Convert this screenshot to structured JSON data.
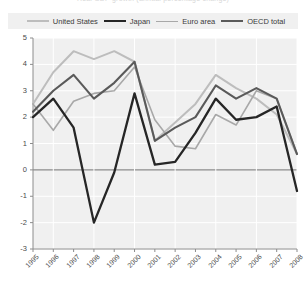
{
  "title": {
    "text": "Real GDP growth (annual percentage change)",
    "clipped": true
  },
  "legend": {
    "items": [
      {
        "label": "United States",
        "color": "#bdbdbd",
        "key": "united_states"
      },
      {
        "label": "Japan",
        "color": "#262626",
        "key": "japan"
      },
      {
        "label": "Euro area",
        "color": "#a8a8a8",
        "key": "euro_area"
      },
      {
        "label": "OECD total",
        "color": "#5a5a5a",
        "key": "oecd_total"
      }
    ]
  },
  "chart_data": {
    "type": "line",
    "title": "",
    "xlabel": "",
    "ylabel": "",
    "x": [
      1995,
      1996,
      1997,
      1998,
      1999,
      2000,
      2001,
      2002,
      2003,
      2004,
      2005,
      2006,
      2007,
      2008
    ],
    "xticklabels": [
      "1995",
      "1996",
      "1997",
      "1998",
      "1999",
      "2000",
      "2001",
      "2002",
      "2003",
      "2004",
      "2005",
      "2006",
      "2007",
      "2008"
    ],
    "ylim": [
      -3,
      5
    ],
    "yticks": [
      -3,
      -2,
      -1,
      0,
      1,
      2,
      3,
      4,
      5
    ],
    "yticklabels": [
      "-3",
      "-2",
      "-1",
      "0",
      "1",
      "2",
      "3",
      "4",
      "5"
    ],
    "grid": true,
    "legend_position": "top",
    "series": [
      {
        "name": "United States",
        "color": "#bdbdbd",
        "width": 2.0,
        "values": [
          2.5,
          3.7,
          4.5,
          4.2,
          4.5,
          4.1,
          1.1,
          1.8,
          2.5,
          3.6,
          3.1,
          2.7,
          2.1,
          0.6
        ]
      },
      {
        "name": "Japan",
        "color": "#262626",
        "width": 2.3,
        "values": [
          2.0,
          2.7,
          1.6,
          -2.0,
          -0.1,
          2.9,
          0.2,
          0.3,
          1.4,
          2.7,
          1.9,
          2.0,
          2.4,
          -0.8
        ]
      },
      {
        "name": "Euro area",
        "color": "#a8a8a8",
        "width": 1.6,
        "values": [
          2.5,
          1.5,
          2.6,
          2.9,
          3.0,
          3.9,
          1.9,
          0.9,
          0.8,
          2.1,
          1.7,
          3.0,
          2.7,
          0.6
        ]
      },
      {
        "name": "OECD total",
        "color": "#5a5a5a",
        "width": 2.1,
        "values": [
          2.2,
          3.0,
          3.6,
          2.7,
          3.3,
          4.1,
          1.1,
          1.6,
          2.0,
          3.2,
          2.7,
          3.1,
          2.7,
          0.6
        ]
      }
    ]
  }
}
